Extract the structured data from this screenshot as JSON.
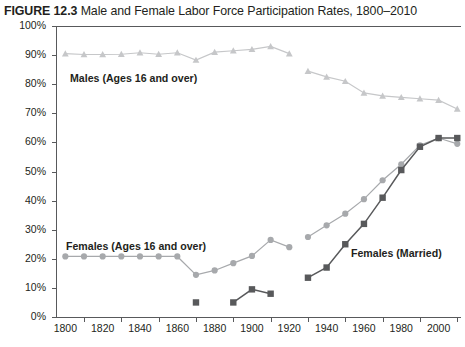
{
  "figure": {
    "number": "FIGURE 12.3",
    "title": "Male and Female Labor Force Participation Rates, 1800–2010"
  },
  "annotations": {
    "males": "Males (Ages 16 and over)",
    "females_all": "Females (Ages 16 and over)",
    "females_married": "Females (Married)"
  },
  "colors": {
    "males": "#c6c7c9",
    "females_all": "#a7a9ac",
    "females_married": "#58595b",
    "axis": "#58595b",
    "text": "#231f20"
  },
  "chart_data": {
    "type": "line",
    "title": "Male and Female Labor Force Participation Rates, 1800–2010",
    "xlabel": "",
    "ylabel": "Percent",
    "xlim": [
      1795,
      2012
    ],
    "ylim": [
      0,
      100
    ],
    "grid": false,
    "legend_position": "inline-annotations",
    "xticks": [
      1800,
      1820,
      1840,
      1860,
      1880,
      1900,
      1920,
      1940,
      1960,
      1980,
      2000
    ],
    "xtick_labels": [
      "1800",
      "1820",
      "1840",
      "1860",
      "1880",
      "1900",
      "1920",
      "1940",
      "1960",
      "1980",
      "2000"
    ],
    "xminor_ticks": [
      1810,
      1830,
      1850,
      1870,
      1890,
      1910,
      1930,
      1950,
      1970,
      1990,
      2010
    ],
    "yticks": [
      0,
      10,
      20,
      30,
      40,
      50,
      60,
      70,
      80,
      90,
      100
    ],
    "ytick_labels": [
      "0%",
      "10%",
      "20%",
      "30%",
      "40%",
      "50%",
      "60%",
      "70%",
      "80%",
      "90%",
      "100%"
    ],
    "series": [
      {
        "name": "Males (Ages 16 and over)",
        "marker": "triangle",
        "color": "#c6c7c9",
        "segments": [
          {
            "x": [
              1800,
              1810,
              1820,
              1830,
              1840,
              1850,
              1860,
              1870,
              1880,
              1890,
              1900,
              1910,
              1920
            ],
            "y": [
              90.5,
              90.2,
              90.2,
              90.3,
              90.8,
              90.3,
              90.8,
              88.3,
              91.0,
              91.5,
              92.0,
              93.0,
              90.5
            ]
          },
          {
            "x": [
              1930,
              1940,
              1950,
              1960,
              1970,
              1980,
              1990,
              2000,
              2010
            ],
            "y": [
              84.5,
              82.5,
              81.0,
              77.0,
              76.0,
              75.5,
              75.0,
              74.5,
              71.5
            ]
          }
        ]
      },
      {
        "name": "Females (Ages 16 and over)",
        "marker": "circle",
        "color": "#a7a9ac",
        "segments": [
          {
            "x": [
              1800,
              1810,
              1820,
              1830,
              1840,
              1850,
              1860,
              1870,
              1880,
              1890,
              1900,
              1910,
              1920
            ],
            "y": [
              20.8,
              20.8,
              20.8,
              20.8,
              20.8,
              20.8,
              20.8,
              14.5,
              16.0,
              18.5,
              21.0,
              26.5,
              24.0
            ]
          },
          {
            "x": [
              1930,
              1940,
              1950,
              1960,
              1970,
              1980,
              1990,
              2000,
              2010
            ],
            "y": [
              27.5,
              31.5,
              35.5,
              40.5,
              47.0,
              52.5,
              59.0,
              61.5,
              59.5
            ]
          }
        ]
      },
      {
        "name": "Females (Married)",
        "marker": "square",
        "color": "#58595b",
        "segments": [
          {
            "x": [
              1870
            ],
            "y": [
              5.0
            ]
          },
          {
            "x": [
              1890,
              1900,
              1910
            ],
            "y": [
              5.0,
              9.5,
              8.0
            ]
          },
          {
            "x": [
              1930,
              1940,
              1950,
              1960,
              1970,
              1980,
              1990,
              2000,
              2010
            ],
            "y": [
              13.5,
              17.0,
              25.0,
              32.0,
              41.0,
              50.5,
              58.5,
              61.5,
              61.5
            ]
          }
        ]
      }
    ]
  }
}
